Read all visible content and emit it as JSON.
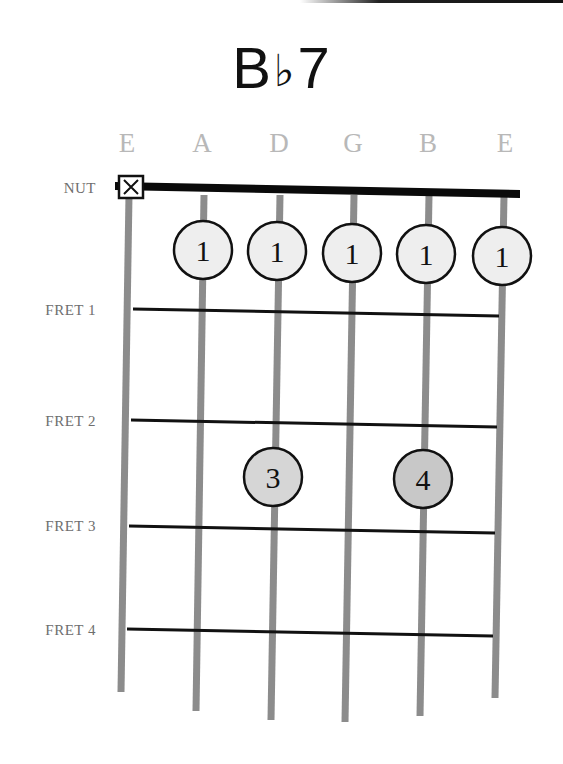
{
  "chord": {
    "name": "Bb7",
    "root": "B",
    "accidental": "♭",
    "quality": "7"
  },
  "strings": [
    {
      "name": "E",
      "x": 127
    },
    {
      "name": "A",
      "x": 202
    },
    {
      "name": "D",
      "x": 279
    },
    {
      "name": "G",
      "x": 353
    },
    {
      "name": "B",
      "x": 428
    },
    {
      "name": "E",
      "x": 505
    }
  ],
  "labels": {
    "nut": "NUT",
    "frets": [
      "FRET 1",
      "FRET 2",
      "FRET 3",
      "FRET 4"
    ]
  },
  "muted_strings": [
    {
      "string": "E",
      "index": 0,
      "symbol": "X"
    }
  ],
  "fingering": [
    {
      "string": "A",
      "position": "open-row",
      "finger": "1"
    },
    {
      "string": "D",
      "position": "open-row",
      "finger": "1"
    },
    {
      "string": "G",
      "position": "open-row",
      "finger": "1"
    },
    {
      "string": "B",
      "position": "open-row",
      "finger": "1"
    },
    {
      "string": "E",
      "position": "open-row",
      "finger": "1"
    },
    {
      "string": "D",
      "position": "fret 2-3",
      "finger": "3"
    },
    {
      "string": "B",
      "position": "fret 2-3",
      "finger": "4"
    }
  ],
  "colors": {
    "string": "#8c8c8c",
    "fret": "#111111",
    "dot_light": "#eeeeee",
    "dot_dark": "#cfcfcf",
    "string_label": "#b8b8b8",
    "fret_label": "#6e6e6e"
  }
}
